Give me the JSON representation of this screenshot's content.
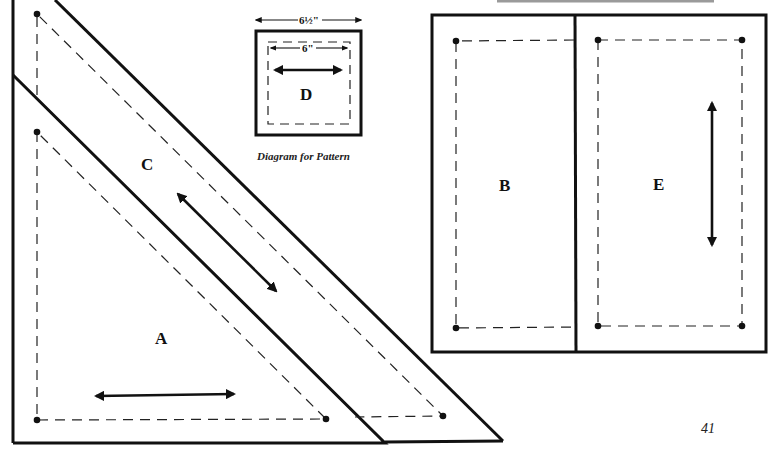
{
  "page": {
    "number": "41",
    "top_rule_color": "#9a9a9a"
  },
  "pieces": {
    "A": {
      "label": "A"
    },
    "B": {
      "label": "B"
    },
    "C": {
      "label": "C"
    },
    "D": {
      "label": "D",
      "outer_dimension": "6½\"",
      "inner_dimension": "6\""
    },
    "E": {
      "label": "E"
    }
  },
  "caption": "Diagram for Pattern",
  "legend": {
    "cut_line": "solid",
    "sewing_line": "dashed",
    "grain_arrow": "double-headed arrow"
  }
}
